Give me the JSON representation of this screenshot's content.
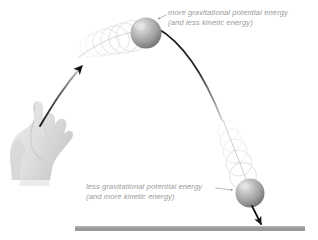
{
  "diagram": {
    "background_color": "#ffffff",
    "labels": {
      "top": {
        "line1": "more gravitational potential energy",
        "line2": "(and less kinetic energy)",
        "color": "#9a9a9a"
      },
      "bottom": {
        "line1": "less gravitational potential energy",
        "line2": "(and more kinetic energy)",
        "color": "#9a9a9a"
      }
    },
    "elements": {
      "hand_label": "hand",
      "ground_label": "ground",
      "ball_apex_label": "ball at apex",
      "ball_descending_label": "ball descending",
      "launch_arrow_label": "launch direction arrow",
      "velocity_arrow_label": "downward velocity arrow",
      "trajectory_label": "trajectory arc",
      "ghost_trail_label": "motion ghost trail"
    },
    "colors": {
      "ground": "#9a9a9a",
      "hand": "#e2e2e2",
      "hand_shade": "#cfcfcf",
      "ball_light": "#d8d8d8",
      "ball_mid": "#a8a8a8",
      "ball_dark": "#6e6e6e",
      "arrow": "#111111",
      "ghost": "#e0e0e0",
      "leader": "#8f8f8f"
    }
  }
}
